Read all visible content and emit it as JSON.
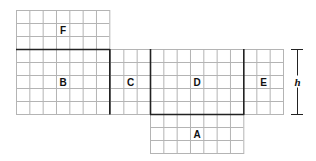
{
  "diagram": {
    "grid": {
      "cell_w": 13.33,
      "cell_h": 13.0,
      "line_color": "#b4b4b4",
      "border_color": "#222222"
    },
    "regions": [
      {
        "id": "F",
        "label": "F",
        "cols": 7,
        "rows": 3,
        "x": 16,
        "y": 10
      },
      {
        "id": "B",
        "label": "B",
        "cols": 7,
        "rows": 5,
        "x": 16,
        "y": 49
      },
      {
        "id": "C",
        "label": "C",
        "cols": 3,
        "rows": 5,
        "x": 110,
        "y": 49
      },
      {
        "id": "D",
        "label": "D",
        "cols": 7,
        "rows": 5,
        "x": 150,
        "y": 49
      },
      {
        "id": "E",
        "label": "E",
        "cols": 3,
        "rows": 5,
        "x": 243,
        "y": 49
      },
      {
        "id": "A",
        "label": "A",
        "cols": 7,
        "rows": 3,
        "x": 150,
        "y": 114
      }
    ],
    "dimension": {
      "label": "h",
      "x": 297,
      "y1": 49,
      "y2": 114
    }
  }
}
